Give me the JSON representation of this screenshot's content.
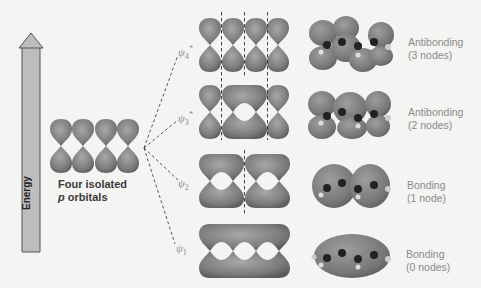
{
  "figure": {
    "axis_label": "Energy",
    "isolated_label_line1": "Four isolated",
    "isolated_label_p": "p",
    "isolated_label_rest": " orbitals",
    "orbitals": [
      {
        "psi": "ψ",
        "sub": "4",
        "star": "*",
        "type": "Antibonding",
        "nodes": "(3 nodes)"
      },
      {
        "psi": "ψ",
        "sub": "3",
        "star": "*",
        "type": "Antibonding",
        "nodes": "(2 nodes)"
      },
      {
        "psi": "ψ",
        "sub": "2",
        "star": "",
        "type": "Bonding",
        "nodes": "(1 node)"
      },
      {
        "psi": "ψ",
        "sub": "1",
        "star": "",
        "type": "Bonding",
        "nodes": "(0 nodes)"
      }
    ]
  },
  "colors": {
    "lobe": "#8c8c8c",
    "lobe_dark": "#5e5e5e",
    "arrow_fill": "#bdbdbd",
    "label_gray": "#8a8a8a"
  }
}
